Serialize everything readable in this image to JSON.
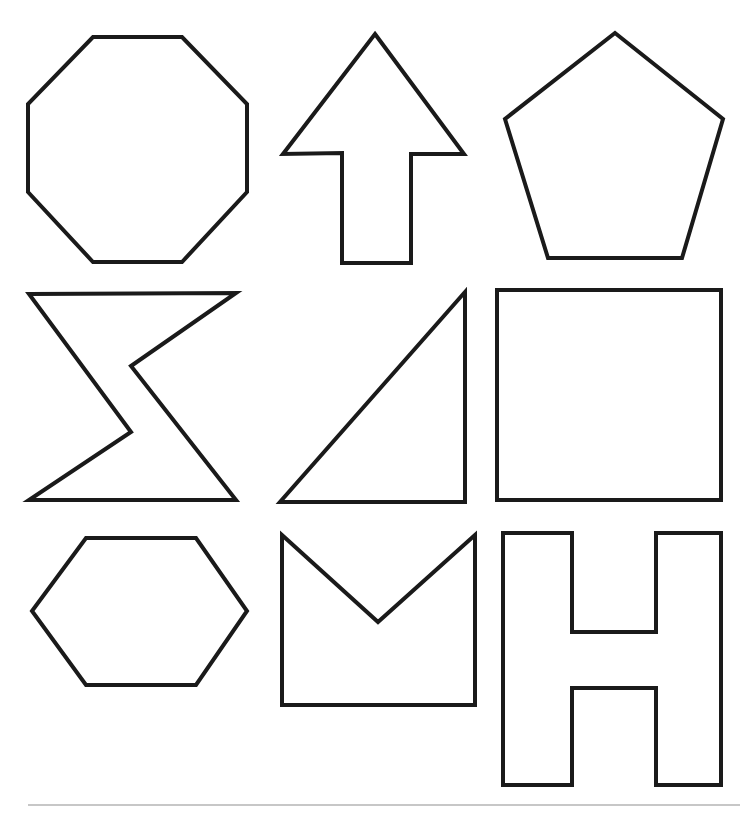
{
  "page": {
    "width": 750,
    "height": 813,
    "background_color": "#ffffff",
    "stroke_color": "#1a1a1a",
    "stroke_width": 4,
    "fill_color": "#ffffff"
  },
  "grid": {
    "rows": 3,
    "columns": 3,
    "count": 9
  },
  "shapes": [
    {
      "id": "octagon",
      "name": "octagon",
      "row": 1,
      "column": 1,
      "sides": 8,
      "points": "93,37 182,37 247,104 247,192 182,262 93,262 28,192 28,104",
      "bbox": [
        28,
        37,
        219,
        225
      ]
    },
    {
      "id": "up-arrow",
      "name": "up-arrow",
      "row": 1,
      "column": 2,
      "sides": 7,
      "points": "375,34 464,154 411,154 411,263 342,263 342,153 283,154",
      "bbox": [
        283,
        34,
        181,
        229
      ]
    },
    {
      "id": "pentagon",
      "name": "pentagon",
      "row": 1,
      "column": 3,
      "sides": 5,
      "points": "615,33 723,119 682,258 548,258 505,119",
      "bbox": [
        505,
        33,
        218,
        225
      ]
    },
    {
      "id": "bowtie",
      "name": "bowtie",
      "row": 2,
      "column": 1,
      "sides": 6,
      "points": "29,294 236,293 131,366 236,500 29,500 131,432",
      "bbox": [
        29,
        293,
        207,
        207
      ]
    },
    {
      "id": "right-triangle",
      "name": "right-triangle",
      "row": 2,
      "column": 2,
      "sides": 3,
      "points": "465,292 465,502 280,502",
      "bbox": [
        280,
        292,
        185,
        210
      ]
    },
    {
      "id": "square",
      "name": "square",
      "row": 2,
      "column": 3,
      "sides": 4,
      "points": "497,290 721,290 721,500 497,500",
      "bbox": [
        497,
        290,
        224,
        210
      ]
    },
    {
      "id": "hexagon",
      "name": "hexagon",
      "row": 3,
      "column": 1,
      "sides": 6,
      "points": "86,538 196,538 247,611 196,685 86,685 32,611",
      "bbox": [
        32,
        538,
        215,
        147
      ]
    },
    {
      "id": "chevron-notch-rectangle",
      "name": "chevron-notch-rectangle",
      "row": 3,
      "column": 2,
      "sides": 5,
      "points": "282,535 378,622 475,535 475,705 282,705",
      "bbox": [
        282,
        535,
        193,
        170
      ]
    },
    {
      "id": "letter-h",
      "name": "letter-h",
      "row": 3,
      "column": 3,
      "sides": 12,
      "points": "503,533 572,533 572,632 656,632 656,533 721,533 721,785 656,785 656,688 572,688 572,785 503,785",
      "bbox": [
        503,
        533,
        218,
        252
      ]
    }
  ],
  "footer_rule": {
    "name": "horizontal-rule",
    "x1": 28,
    "y1": 805,
    "x2": 740,
    "y2": 805,
    "color": "#b4b4b4"
  }
}
